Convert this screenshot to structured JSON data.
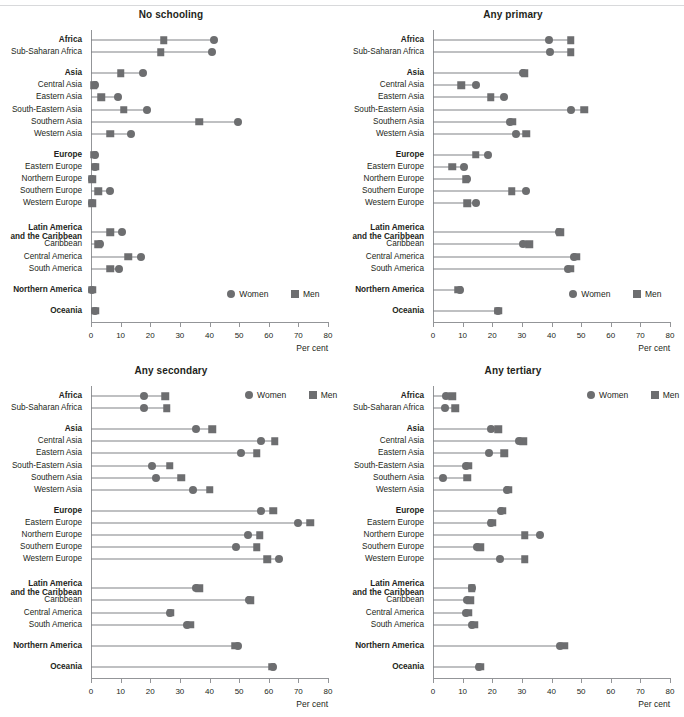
{
  "legend": {
    "women_label": "Women",
    "men_label": "Men",
    "women_icon": "circle-marker",
    "men_icon": "square-marker"
  },
  "axis": {
    "xlabel": "Per cent",
    "ticks": [
      "0",
      "10",
      "20",
      "30",
      "40",
      "50",
      "60",
      "70",
      "80"
    ],
    "xmin": 0,
    "xmax": 80
  },
  "colors": {
    "marker": "#6d6e70",
    "connector": "#808285",
    "axis": "#939598",
    "text": "#231f20"
  },
  "categories": [
    {
      "label": "Africa",
      "bold": true,
      "gap_before": 0
    },
    {
      "label": "Sub-Saharan Africa",
      "bold": false,
      "gap_before": 0
    },
    {
      "label": "Asia",
      "bold": true,
      "gap_before": 1
    },
    {
      "label": "Central Asia",
      "bold": false,
      "gap_before": 0
    },
    {
      "label": "Eastern Asia",
      "bold": false,
      "gap_before": 0
    },
    {
      "label": "South-Eastern Asia",
      "bold": false,
      "gap_before": 0
    },
    {
      "label": "Southern Asia",
      "bold": false,
      "gap_before": 0
    },
    {
      "label": "Western Asia",
      "bold": false,
      "gap_before": 0
    },
    {
      "label": "Europe",
      "bold": true,
      "gap_before": 1
    },
    {
      "label": "Eastern Europe",
      "bold": false,
      "gap_before": 0
    },
    {
      "label": "Northern Europe",
      "bold": false,
      "gap_before": 0
    },
    {
      "label": "Southern Europe",
      "bold": false,
      "gap_before": 0
    },
    {
      "label": "Western Europe",
      "bold": false,
      "gap_before": 0
    },
    {
      "label": "Latin America\nand the Caribbean",
      "bold": true,
      "gap_before": 1
    },
    {
      "label": "Caribbean",
      "bold": false,
      "gap_before": 0
    },
    {
      "label": "Central America",
      "bold": false,
      "gap_before": 0
    },
    {
      "label": "South America",
      "bold": false,
      "gap_before": 0
    },
    {
      "label": "Northern America",
      "bold": true,
      "gap_before": 1
    },
    {
      "label": "Oceania",
      "bold": true,
      "gap_before": 1
    }
  ],
  "chart_data": [
    {
      "id": "no-schooling",
      "type": "scatter",
      "title": "No schooling",
      "xlabel": "Per cent",
      "ylabel": "",
      "xlim": [
        0,
        80
      ],
      "grid": false,
      "legend_position": "bottom-right-inside",
      "categories": [
        "Africa",
        "Sub-Saharan Africa",
        "Asia",
        "Central Asia",
        "Eastern Asia",
        "South-Eastern Asia",
        "Southern Asia",
        "Western Asia",
        "Europe",
        "Eastern Europe",
        "Northern Europe",
        "Southern Europe",
        "Western Europe",
        "Latin America and the Caribbean",
        "Caribbean",
        "Central America",
        "South America",
        "Northern America",
        "Oceania"
      ],
      "series": [
        {
          "name": "Women",
          "marker": "circle",
          "values": [
            41.5,
            41.0,
            17.5,
            1.5,
            9.0,
            19.0,
            49.5,
            13.5,
            1.5,
            1.5,
            0.5,
            6.5,
            0.5,
            10.5,
            3.0,
            17.0,
            9.5,
            0.5,
            1.5
          ]
        },
        {
          "name": "Men",
          "marker": "square",
          "values": [
            24.5,
            23.5,
            10.0,
            1.0,
            3.5,
            11.0,
            36.5,
            6.5,
            1.0,
            1.5,
            0.5,
            2.5,
            0.5,
            6.5,
            2.5,
            12.5,
            6.5,
            0.5,
            1.5
          ]
        }
      ]
    },
    {
      "id": "any-primary",
      "type": "scatter",
      "title": "Any primary",
      "xlabel": "Per cent",
      "ylabel": "",
      "xlim": [
        0,
        80
      ],
      "grid": false,
      "legend_position": "bottom-right-inside",
      "categories": [
        "Africa",
        "Sub-Saharan Africa",
        "Asia",
        "Central Asia",
        "Eastern Asia",
        "South-Eastern Asia",
        "Southern Asia",
        "Western Asia",
        "Europe",
        "Eastern Europe",
        "Northern Europe",
        "Southern Europe",
        "Western Europe",
        "Latin America and the Caribbean",
        "Caribbean",
        "Central America",
        "South America",
        "Northern America",
        "Oceania"
      ],
      "series": [
        {
          "name": "Women",
          "marker": "circle",
          "values": [
            39.0,
            39.5,
            30.5,
            14.5,
            24.0,
            46.5,
            26.0,
            28.0,
            18.5,
            10.5,
            11.5,
            31.5,
            14.5,
            42.5,
            30.5,
            47.5,
            45.5,
            9.0,
            22.0
          ]
        },
        {
          "name": "Men",
          "marker": "square",
          "values": [
            46.5,
            46.5,
            31.0,
            9.5,
            19.5,
            51.0,
            27.0,
            31.5,
            14.5,
            6.5,
            11.0,
            26.5,
            11.5,
            43.0,
            32.5,
            48.5,
            46.5,
            8.5,
            22.0
          ]
        }
      ]
    },
    {
      "id": "any-secondary",
      "type": "scatter",
      "title": "Any secondary",
      "xlabel": "Per cent",
      "ylabel": "",
      "xlim": [
        0,
        80
      ],
      "grid": false,
      "legend_position": "top-right-inside",
      "categories": [
        "Africa",
        "Sub-Saharan Africa",
        "Asia",
        "Central Asia",
        "Eastern Asia",
        "South-Eastern Asia",
        "Southern Asia",
        "Western Asia",
        "Europe",
        "Eastern Europe",
        "Northern Europe",
        "Southern Europe",
        "Western Europe",
        "Latin America and the Caribbean",
        "Caribbean",
        "Central America",
        "South America",
        "Northern America",
        "Oceania"
      ],
      "series": [
        {
          "name": "Women",
          "marker": "circle",
          "values": [
            18.0,
            18.0,
            35.5,
            57.5,
            50.5,
            20.5,
            22.0,
            34.5,
            57.5,
            70.0,
            53.0,
            49.0,
            63.5,
            35.5,
            53.5,
            26.5,
            32.5,
            49.5,
            61.5
          ]
        },
        {
          "name": "Men",
          "marker": "square",
          "values": [
            25.0,
            25.5,
            41.0,
            62.0,
            56.0,
            26.5,
            30.5,
            40.0,
            61.5,
            74.0,
            57.0,
            56.0,
            59.5,
            36.5,
            54.0,
            27.0,
            33.5,
            48.5,
            61.0
          ]
        }
      ]
    },
    {
      "id": "any-tertiary",
      "type": "scatter",
      "title": "Any tertiary",
      "xlabel": "Per cent",
      "ylabel": "",
      "xlim": [
        0,
        80
      ],
      "grid": false,
      "legend_position": "top-right-inside",
      "categories": [
        "Africa",
        "Sub-Saharan Africa",
        "Asia",
        "Central Asia",
        "Eastern Asia",
        "South-Eastern Asia",
        "Southern Asia",
        "Western Asia",
        "Europe",
        "Eastern Europe",
        "Northern Europe",
        "Southern Europe",
        "Western Europe",
        "Latin America and the Caribbean",
        "Caribbean",
        "Central America",
        "South America",
        "Northern America",
        "Oceania"
      ],
      "series": [
        {
          "name": "Women",
          "marker": "circle",
          "values": [
            4.5,
            4.0,
            19.5,
            29.0,
            19.0,
            11.0,
            3.5,
            25.0,
            23.0,
            19.5,
            36.0,
            15.0,
            22.5,
            13.0,
            11.5,
            11.0,
            13.0,
            43.0,
            15.5
          ]
        },
        {
          "name": "Men",
          "marker": "square",
          "values": [
            6.5,
            7.5,
            22.0,
            30.5,
            24.0,
            12.0,
            11.5,
            25.5,
            23.5,
            20.0,
            31.0,
            16.0,
            31.0,
            13.0,
            12.5,
            12.0,
            14.0,
            44.5,
            16.0
          ]
        }
      ]
    }
  ]
}
